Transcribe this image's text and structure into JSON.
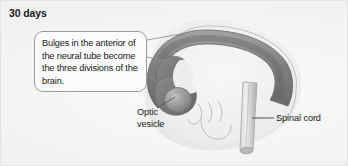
{
  "figure": {
    "title": "30 days",
    "background_color": "#f2f2f2"
  },
  "callout": {
    "text": "Bulges in the anterior of the neural tube become the three divisions of the brain.",
    "border_color": "#9a9a9a",
    "fill_color": "#fbfbfb",
    "leader_line_count": 3
  },
  "labels": [
    {
      "id": "optic-vesicle",
      "text": "Optic\nvesicle",
      "leader": "up-right"
    },
    {
      "id": "spinal-cord",
      "text": "Spinal cord",
      "leader": "left"
    }
  ],
  "illustration": {
    "neural_tube_color": "#8f8f8f",
    "neural_tube_dark_color": "#6e6e6e",
    "body_outline_color": "#b5b5b5",
    "spinal_cord_color": "#c9c9c9",
    "optic_vesicle_color": "#9c9c9c"
  }
}
